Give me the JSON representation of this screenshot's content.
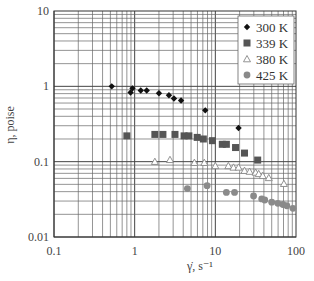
{
  "chart_data": {
    "type": "scatter",
    "title": "",
    "xlabel": "γ̇, s⁻¹",
    "ylabel": "η, poise",
    "xscale": "log",
    "yscale": "log",
    "xlim": [
      0.1,
      100
    ],
    "ylim": [
      0.01,
      10
    ],
    "x_ticks": [
      "0.1",
      "1",
      "10",
      "100"
    ],
    "y_ticks": [
      "0.01",
      "0.1",
      "1",
      "10"
    ],
    "grid": true,
    "legend_position": "upper right",
    "series": [
      {
        "name": "300 K",
        "marker": "diamond",
        "color": "#111111",
        "points": [
          [
            0.52,
            1.0
          ],
          [
            0.89,
            0.83
          ],
          [
            0.94,
            0.94
          ],
          [
            1.19,
            0.88
          ],
          [
            1.41,
            0.88
          ],
          [
            2.0,
            0.81
          ],
          [
            2.66,
            0.76
          ],
          [
            3.07,
            0.69
          ],
          [
            3.76,
            0.65
          ],
          [
            7.5,
            0.48
          ],
          [
            19.4,
            0.28
          ]
        ]
      },
      {
        "name": "339 K",
        "marker": "square",
        "color": "#555555",
        "points": [
          [
            0.8,
            0.22
          ],
          [
            1.78,
            0.23
          ],
          [
            2.24,
            0.23
          ],
          [
            3.16,
            0.23
          ],
          [
            4.1,
            0.22
          ],
          [
            4.7,
            0.22
          ],
          [
            5.96,
            0.21
          ],
          [
            7.1,
            0.2
          ],
          [
            9.2,
            0.19
          ],
          [
            12.2,
            0.17
          ],
          [
            13.7,
            0.17
          ],
          [
            17.8,
            0.154
          ],
          [
            23,
            0.13
          ],
          [
            33.5,
            0.105
          ]
        ]
      },
      {
        "name": "380 K",
        "marker": "triangle-open",
        "color": "#888888",
        "points": [
          [
            1.78,
            0.1
          ],
          [
            2.74,
            0.106
          ],
          [
            5.5,
            0.097
          ],
          [
            7.3,
            0.097
          ],
          [
            10,
            0.088
          ],
          [
            14.5,
            0.088
          ],
          [
            16.8,
            0.084
          ],
          [
            19.4,
            0.084
          ],
          [
            23,
            0.076
          ],
          [
            26.6,
            0.074
          ],
          [
            31.6,
            0.072
          ],
          [
            34.5,
            0.069
          ],
          [
            38.7,
            0.065
          ],
          [
            46,
            0.061
          ],
          [
            70.8,
            0.051
          ]
        ]
      },
      {
        "name": "425 K",
        "marker": "circle",
        "color": "#8a8a8a",
        "points": [
          [
            4.5,
            0.044
          ],
          [
            7.9,
            0.048
          ],
          [
            13.7,
            0.039
          ],
          [
            17.3,
            0.039
          ],
          [
            29.8,
            0.035
          ],
          [
            37.6,
            0.032
          ],
          [
            41,
            0.031
          ],
          [
            50,
            0.029
          ],
          [
            59.5,
            0.028
          ],
          [
            68.8,
            0.027
          ],
          [
            77,
            0.026
          ],
          [
            91.6,
            0.024
          ]
        ]
      }
    ]
  }
}
